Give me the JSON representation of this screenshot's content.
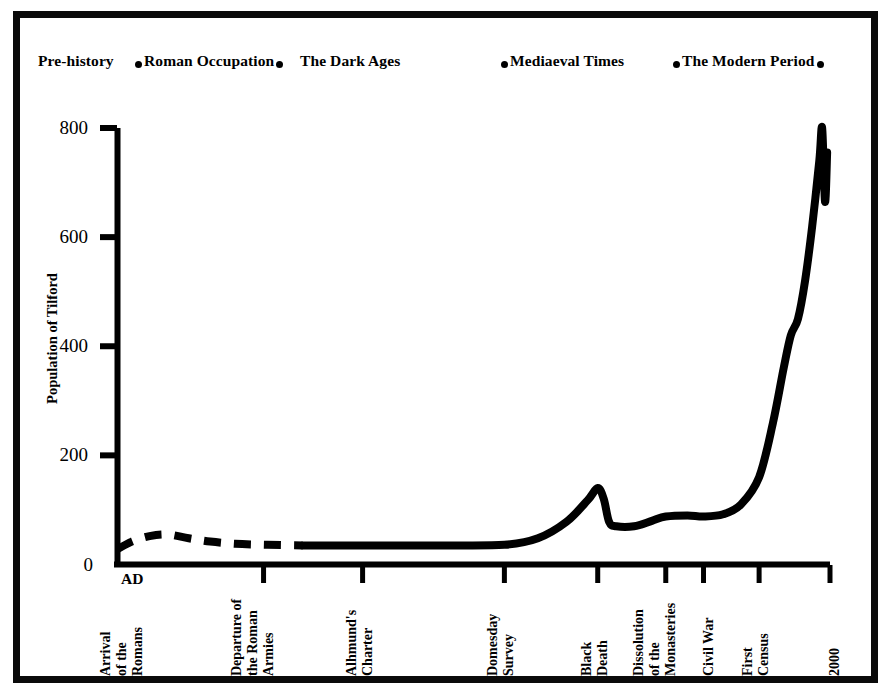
{
  "figure": {
    "border_color": "#0a0a0a",
    "line_color": "#000000",
    "background": "#ffffff"
  },
  "eras": [
    {
      "label": "Pre-history",
      "x": 16,
      "dot_before": false,
      "dot_after": false
    },
    {
      "label": "Roman Occupation",
      "x": 122,
      "dot_before": true,
      "dot_after": true
    },
    {
      "label": "The Dark Ages",
      "x": 278,
      "dot_before": false,
      "dot_after": false
    },
    {
      "label": "Mediaeval Times",
      "x": 488,
      "dot_before": true,
      "dot_after": false
    },
    {
      "label": "The Modern Period",
      "x": 660,
      "dot_before": true,
      "dot_after": true
    }
  ],
  "axes": {
    "y_title": "Population of Tilford",
    "y_ticks": [
      "800",
      "600",
      "400",
      "200",
      "0"
    ],
    "y_tick_values": [
      800,
      600,
      400,
      200,
      0
    ],
    "y_range": [
      0,
      800
    ],
    "x_origin_label": "AD",
    "x_ticks": [
      {
        "lines": [
          "Arrival",
          "of the",
          "Romans"
        ],
        "value": 43
      },
      {
        "lines": [
          "Departure of",
          "the Roman",
          "Armies"
        ],
        "value": 410
      },
      {
        "lines": [
          "Alhmund's",
          "Charter"
        ],
        "value": 688
      },
      {
        "lines": [
          "Domesday",
          "Survey"
        ],
        "value": 1086
      },
      {
        "lines": [
          "Black",
          "Death"
        ],
        "value": 1348
      },
      {
        "lines": [
          "Dissolution",
          "of the",
          "Monasteries"
        ],
        "value": 1539
      },
      {
        "lines": [
          "Civil War"
        ],
        "value": 1645
      },
      {
        "lines": [
          "First",
          "Census"
        ],
        "value": 1801
      },
      {
        "lines": [
          "2000"
        ],
        "value": 2000
      }
    ]
  },
  "chart_data": {
    "type": "line",
    "xlabel": "",
    "ylabel": "Population of Tilford",
    "ylim": [
      0,
      800
    ],
    "grid": false,
    "legend": false,
    "series": [
      {
        "name": "Population of Tilford (estimated, pre-history to Roman departure)",
        "style": "dashed",
        "x_labels": [
          "Arrival of the Romans",
          "",
          "",
          "",
          "",
          "Departure of the Roman Armies"
        ],
        "points": [
          {
            "x": 0,
            "y": 28
          },
          {
            "x": 40,
            "y": 42
          },
          {
            "x": 90,
            "y": 52
          },
          {
            "x": 140,
            "y": 55
          },
          {
            "x": 200,
            "y": 48
          },
          {
            "x": 260,
            "y": 42
          },
          {
            "x": 330,
            "y": 38
          },
          {
            "x": 420,
            "y": 36
          },
          {
            "x": 520,
            "y": 35
          }
        ]
      },
      {
        "name": "Population of Tilford (recorded, Dark Ages to present)",
        "style": "solid",
        "points": [
          {
            "x": 520,
            "y": 35
          },
          {
            "x": 688,
            "y": 35
          },
          {
            "x": 900,
            "y": 35
          },
          {
            "x": 1086,
            "y": 36
          },
          {
            "x": 1180,
            "y": 48
          },
          {
            "x": 1260,
            "y": 78
          },
          {
            "x": 1320,
            "y": 118
          },
          {
            "x": 1348,
            "y": 140
          },
          {
            "x": 1365,
            "y": 120
          },
          {
            "x": 1380,
            "y": 78
          },
          {
            "x": 1400,
            "y": 70
          },
          {
            "x": 1450,
            "y": 70
          },
          {
            "x": 1500,
            "y": 80
          },
          {
            "x": 1539,
            "y": 88
          },
          {
            "x": 1600,
            "y": 90
          },
          {
            "x": 1645,
            "y": 88
          },
          {
            "x": 1700,
            "y": 92
          },
          {
            "x": 1750,
            "y": 110
          },
          {
            "x": 1801,
            "y": 160
          },
          {
            "x": 1840,
            "y": 260
          },
          {
            "x": 1870,
            "y": 360
          },
          {
            "x": 1890,
            "y": 420
          },
          {
            "x": 1910,
            "y": 450
          },
          {
            "x": 1930,
            "y": 520
          },
          {
            "x": 1950,
            "y": 620
          },
          {
            "x": 1970,
            "y": 740
          },
          {
            "x": 1978,
            "y": 800
          },
          {
            "x": 1986,
            "y": 665
          },
          {
            "x": 1992,
            "y": 755
          }
        ]
      }
    ],
    "annotations": [
      {
        "label": "Black Death",
        "x": 1348,
        "note": "sharp population peak then collapse"
      },
      {
        "label": "Modern surge",
        "x": 1978,
        "note": "rise to about 800 then dip and recovery"
      }
    ]
  }
}
